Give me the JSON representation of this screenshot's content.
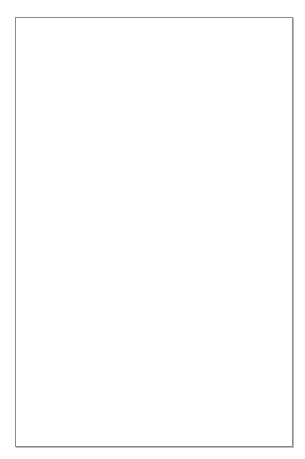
{
  "figure": {
    "type": "dendrogram",
    "header_columns": [
      {
        "x": 32,
        "w": 16,
        "lines": 3
      },
      {
        "x": 48,
        "w": 15,
        "lines": 1
      },
      {
        "x": 63,
        "w": 17,
        "lines": 2
      },
      {
        "x": 80,
        "w": 16,
        "lines": 4
      },
      {
        "x": 96,
        "w": 16,
        "lines": 3
      },
      {
        "x": 112,
        "w": 17,
        "lines": 4
      },
      {
        "x": 129,
        "w": 14,
        "lines": 4
      },
      {
        "x": 143,
        "w": 16,
        "lines": 2
      },
      {
        "x": 159,
        "w": 16,
        "lines": 3
      },
      {
        "x": 175,
        "w": 15,
        "lines": 2
      },
      {
        "x": 190,
        "w": 15,
        "lines": 2
      },
      {
        "x": 205,
        "w": 16,
        "lines": 2
      },
      {
        "x": 221,
        "w": 15,
        "lines": 3
      },
      {
        "x": 236,
        "w": 16,
        "lines": 2
      }
    ],
    "free_headers": [
      {
        "x": 254,
        "w": 8,
        "lines": 1
      },
      {
        "x": 270,
        "w": 8,
        "lines": 4
      }
    ],
    "leaf_count": 118,
    "leaf_top": 50,
    "leaf_bottom": 433,
    "leaf_x_end": 250,
    "line_color": "#6f6f6f",
    "leaf_line_color": "#9a9a9a",
    "text_note": "Column header and leaf label text is illegible at this resolution"
  }
}
